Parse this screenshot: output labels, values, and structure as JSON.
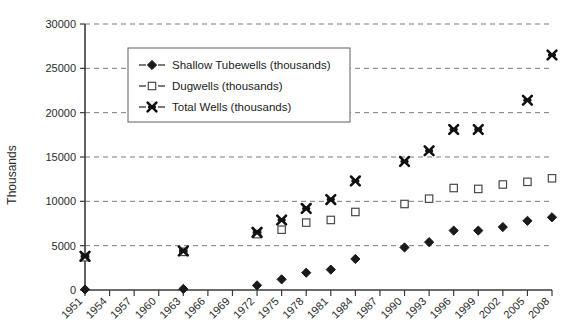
{
  "chart_data": {
    "type": "scatter",
    "title": "",
    "subtitle": "",
    "xlabel": "",
    "ylabel": "Thousands",
    "grid": true,
    "legend_position": "inside-top-left",
    "categories": [
      "1951",
      "1954",
      "1957",
      "1960",
      "1963",
      "1966",
      "1969",
      "1972",
      "1975",
      "1978",
      "1981",
      "1984",
      "1987",
      "1990",
      "1993",
      "1996",
      "1999",
      "2002",
      "2005",
      "2008"
    ],
    "xlim": [
      1951,
      2008
    ],
    "ylim": [
      0,
      30000
    ],
    "ytick_labels": [
      "0",
      "5000",
      "10000",
      "15000",
      "20000",
      "25000",
      "30000"
    ],
    "ytick_values": [
      0,
      5000,
      10000,
      15000,
      20000,
      25000,
      30000
    ],
    "series": [
      {
        "name": "Shallow Tubewells (thousands)",
        "marker": "diamond",
        "color": "#1a1a1a",
        "x": [
          1951,
          1963,
          1972,
          1975,
          1978,
          1981,
          1984,
          1990,
          1993,
          1996,
          1999,
          2002,
          2005,
          2008
        ],
        "values": [
          60,
          120,
          520,
          1200,
          1950,
          2300,
          3500,
          4800,
          5400,
          6700,
          6700,
          7100,
          7800,
          8200
        ]
      },
      {
        "name": "Dugwells (thousands)",
        "marker": "square",
        "color": "#ffffff",
        "x": [
          1951,
          1963,
          1972,
          1975,
          1978,
          1981,
          1984,
          1990,
          1993,
          1996,
          1999,
          2002,
          2005,
          2008
        ],
        "values": [
          3700,
          4300,
          6300,
          6800,
          7600,
          7900,
          8800,
          9700,
          10300,
          11500,
          11400,
          11900,
          12200,
          12600
        ]
      },
      {
        "name": "Total Wells (thousands)",
        "marker": "cross",
        "color": "#1a1a1a",
        "x": [
          1951,
          1963,
          1972,
          1975,
          1978,
          1981,
          1984,
          1990,
          1993,
          1996,
          1999,
          2005,
          2008
        ],
        "values": [
          3800,
          4400,
          6500,
          7900,
          9200,
          10200,
          12300,
          14500,
          15700,
          18100,
          18100,
          21400,
          26500
        ]
      }
    ]
  },
  "legend": {
    "items": [
      {
        "label": "Shallow Tubewells (thousands)",
        "marker": "diamond"
      },
      {
        "label": "Dugwells (thousands)",
        "marker": "square"
      },
      {
        "label": "Total Wells (thousands)",
        "marker": "cross"
      }
    ]
  }
}
